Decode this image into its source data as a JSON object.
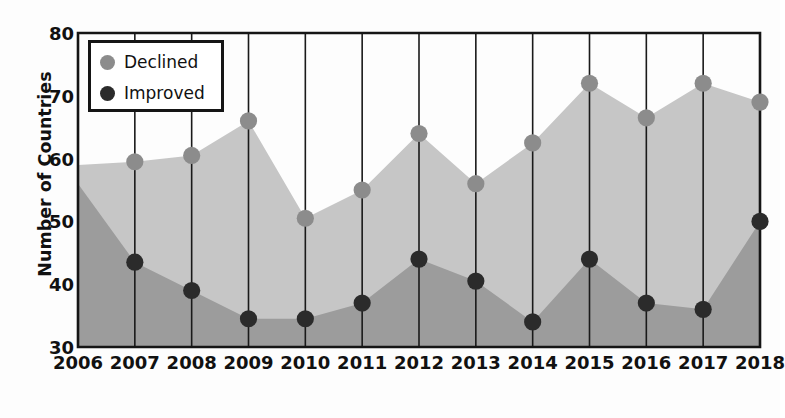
{
  "chart_data": {
    "type": "area",
    "title": "",
    "xlabel": "",
    "ylabel": "Number of Countries",
    "categories": [
      "2006",
      "2007",
      "2008",
      "2009",
      "2010",
      "2011",
      "2012",
      "2013",
      "2014",
      "2015",
      "2016",
      "2017",
      "2018"
    ],
    "x": [
      2006,
      2007,
      2008,
      2009,
      2010,
      2011,
      2012,
      2013,
      2014,
      2015,
      2016,
      2017,
      2018
    ],
    "ylim": [
      30,
      80
    ],
    "xlim": [
      2006,
      2018
    ],
    "yticks": [
      30,
      40,
      50,
      60,
      70,
      80
    ],
    "grid": "vertical",
    "legend_position": "upper-left",
    "series": [
      {
        "name": "Declined",
        "color": "#8c8c8c",
        "fill_color": "#c6c6c6",
        "values": [
          59,
          59.5,
          60.5,
          66,
          50.5,
          55,
          64,
          56,
          62.5,
          72,
          66.5,
          72,
          69
        ],
        "markers": [
          false,
          true,
          true,
          true,
          true,
          true,
          true,
          true,
          true,
          true,
          true,
          true,
          true
        ]
      },
      {
        "name": "Improved",
        "color": "#2b2b2b",
        "fill_color": "#9c9c9c",
        "values": [
          56,
          43.5,
          39,
          34.5,
          34.5,
          37,
          44,
          40.5,
          34,
          44,
          37,
          36,
          50
        ],
        "markers": [
          false,
          true,
          true,
          true,
          true,
          true,
          true,
          true,
          true,
          true,
          true,
          true,
          true
        ]
      }
    ]
  },
  "axes": {
    "y_label": "Number of Countries",
    "y_tick_labels": [
      "80",
      "70",
      "60",
      "50",
      "40",
      "30"
    ],
    "x_tick_labels": [
      "2006",
      "2007",
      "2008",
      "2009",
      "2010",
      "2011",
      "2012",
      "2013",
      "2014",
      "2015",
      "2016",
      "2017",
      "2018"
    ]
  },
  "legend": {
    "items": [
      {
        "label": "Declined",
        "color": "#8c8c8c"
      },
      {
        "label": "Improved",
        "color": "#2b2b2b"
      }
    ]
  },
  "colors": {
    "declined_marker": "#8c8c8c",
    "declined_area": "#c6c6c6",
    "improved_marker": "#2b2b2b",
    "improved_area": "#9c9c9c",
    "axis": "#151515",
    "gridline": "#1a1a1a",
    "background": "#fdfdfd"
  }
}
